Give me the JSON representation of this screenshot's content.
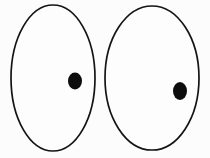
{
  "figure": {
    "title": "Two ovals each containing a filled dot",
    "type": "line-art-diagram",
    "canvas": {
      "width": 210,
      "height": 158,
      "background_color": "#fcfcfc"
    },
    "stroke_color": "#141414",
    "fill_color": "#0d0d0d",
    "interior_color": "#fdfdfd",
    "shapes": [
      {
        "name": "left-oval",
        "kind": "ellipse-outline",
        "cx": 53,
        "cy": 78,
        "rx": 42,
        "ry": 73,
        "stroke_width": 1.7,
        "label": ""
      },
      {
        "name": "left-dot",
        "kind": "ellipse-filled",
        "cx": 75,
        "cy": 81,
        "rx": 7,
        "ry": 8.5,
        "stroke_width": 0,
        "label": ""
      },
      {
        "name": "right-oval",
        "kind": "ellipse-outline",
        "cx": 152,
        "cy": 78,
        "rx": 47,
        "ry": 72,
        "stroke_width": 1.7,
        "label": ""
      },
      {
        "name": "right-dot",
        "kind": "ellipse-filled",
        "cx": 180,
        "cy": 91,
        "rx": 7,
        "ry": 9,
        "stroke_width": 0,
        "label": ""
      }
    ]
  }
}
